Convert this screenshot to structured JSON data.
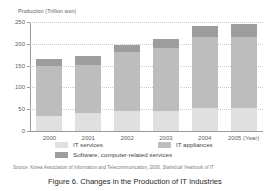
{
  "chart_data": {
    "type": "bar",
    "stacked": true,
    "title": "",
    "xlabel": "Year",
    "ylabel": "Production (Trillion won)",
    "ylim": [
      0,
      250
    ],
    "yticks": [
      0,
      50,
      100,
      150,
      200,
      250
    ],
    "grid": true,
    "legend_position": "bottom",
    "categories": [
      "2000",
      "2001",
      "2002",
      "2003",
      "2004",
      "2005"
    ],
    "x_axis_suffix": "(Year)",
    "series": [
      {
        "name": "IT services",
        "color": "#e0e0e0",
        "values": [
          35,
          41,
          47,
          46,
          52,
          53
        ]
      },
      {
        "name": "IT appliances",
        "color": "#bdbdbd",
        "values": [
          113,
          111,
          135,
          144,
          163,
          162
        ]
      },
      {
        "name": "Software, computer-related services",
        "color": "#9d9d9d",
        "values": [
          17,
          21,
          15,
          21,
          25,
          30
        ]
      }
    ],
    "totals": [
      165,
      173,
      197,
      211,
      240,
      245
    ]
  },
  "axis": {
    "y_unit_label": "Production (Trillion won)",
    "y_ticks": [
      "250",
      "200",
      "150",
      "100",
      "50",
      "0"
    ],
    "x_ticks": [
      "2000",
      "2001",
      "2002",
      "2003",
      "2004",
      "2005 (Year)"
    ]
  },
  "legend": {
    "items": [
      {
        "label": "IT services",
        "color": "#e0e0e0"
      },
      {
        "label": "IT appliances",
        "color": "#bdbdbd"
      },
      {
        "label": "Software, computer-related services",
        "color": "#9d9d9d"
      }
    ]
  },
  "source": {
    "prefix": "Source:",
    "body": "Korea Association of Information and Telecommunication, 2006,",
    "publication": "Statistical Yearbook of IT"
  },
  "caption": {
    "text": "Figure 6. Changes in the Production of IT Industries"
  }
}
